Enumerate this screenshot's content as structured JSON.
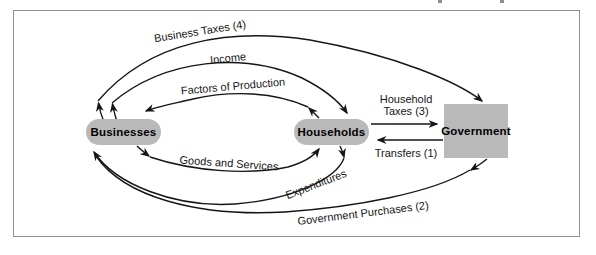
{
  "diagram": {
    "title_hint": "circular-flow-of-income-with-government",
    "nodes": {
      "businesses": {
        "label": "Businesses"
      },
      "households": {
        "label": "Households"
      },
      "government": {
        "label": "Government"
      }
    },
    "flows": {
      "business_taxes": {
        "label": "Business Taxes (4)",
        "from": "Businesses",
        "to": "Government"
      },
      "income": {
        "label": "Income",
        "from": "Businesses",
        "to": "Households"
      },
      "factors_of_production": {
        "label": "Factors of Production",
        "from": "Households",
        "to": "Businesses"
      },
      "household_taxes": {
        "label": "Household Taxes (3)",
        "label_line1": "Household",
        "label_line2": "Taxes (3)",
        "from": "Households",
        "to": "Government"
      },
      "transfers": {
        "label": "Transfers (1)",
        "from": "Government",
        "to": "Households"
      },
      "goods_and_services": {
        "label": "Goods and Services",
        "from": "Businesses",
        "to": "Households"
      },
      "expenditures": {
        "label": "Expenditures",
        "from": "Households",
        "to": "Businesses"
      },
      "government_purchases": {
        "label": "Government Purchases (2)",
        "from": "Government",
        "to": "Businesses"
      }
    },
    "colors": {
      "node_fill": "#b9b9b9",
      "arrow": "#161616",
      "frame_border": "#8f8f8f",
      "background": "#ffffff"
    }
  }
}
